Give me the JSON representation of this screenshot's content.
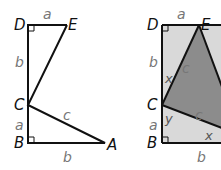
{
  "figures": [
    {
      "id": "left",
      "points": {
        "D": "D",
        "E": "E",
        "C": "C",
        "B": "B",
        "A": "A"
      },
      "sides": {
        "DE": "a",
        "DC": "b",
        "CB": "a",
        "BA": "b",
        "CA": "c"
      }
    },
    {
      "id": "right",
      "points": {
        "D": "D",
        "E": "E",
        "C": "C",
        "B": "B"
      },
      "sides": {
        "DE": "a",
        "DC": "b",
        "CB": "a",
        "B_bottom": "b",
        "CE": "c",
        "CA": "c"
      },
      "angles": {
        "x_top": "x",
        "y": "y",
        "x_bottom": "x"
      }
    }
  ],
  "colors": {
    "line": "#111111",
    "light_fill": "#d9d9d9",
    "dark_fill": "#8c8c8c",
    "side_label": "#777777"
  }
}
